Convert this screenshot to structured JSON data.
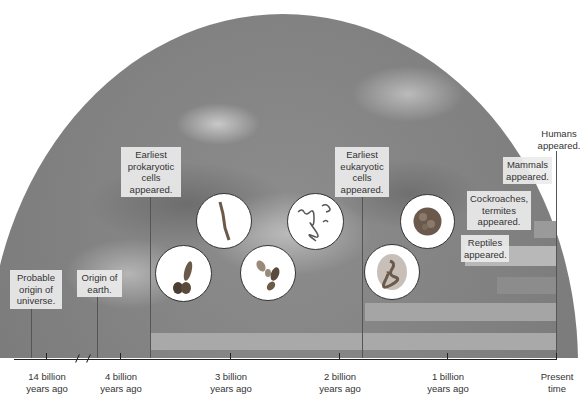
{
  "diagram": {
    "title": "",
    "background": "satellite image of Earth (grayscale)",
    "events": [
      {
        "label": "Probable\norigin of\nuniverse."
      },
      {
        "label": "Origin of\nearth."
      },
      {
        "label": "Earliest\nprokaryotic\ncells\nappeared."
      },
      {
        "label": "Earliest\neukaryotic\ncells\nappeared."
      },
      {
        "label": "Cockroaches,\ntermites\nappeared."
      },
      {
        "label": "Reptiles\nappeared."
      },
      {
        "label": "Mammals\nappeared."
      },
      {
        "label": "Humans\nappeared."
      }
    ],
    "timeline": {
      "ticks": [
        {
          "label": "14 billion\nyears ago"
        },
        {
          "label": "4 billion\nyears ago"
        },
        {
          "label": "3 billion\nyears ago"
        },
        {
          "label": "2 billion\nyears ago"
        },
        {
          "label": "1 billion\nyears ago"
        },
        {
          "label": "Present\ntime"
        }
      ],
      "axis_break": "//"
    },
    "micrographs": [
      {
        "name": "prokaryote-cocci-rod"
      },
      {
        "name": "prokaryote-filament"
      },
      {
        "name": "prokaryote-dividing"
      },
      {
        "name": "prokaryote-spirochete"
      },
      {
        "name": "eukaryote-round-cell"
      },
      {
        "name": "eukaryote-nucleated-cell"
      }
    ],
    "colors": {
      "bar": "#a9a9a9",
      "bar_dark": "#8c8c8c",
      "axis": "#222222",
      "label_bg": "#ebebeb"
    }
  }
}
